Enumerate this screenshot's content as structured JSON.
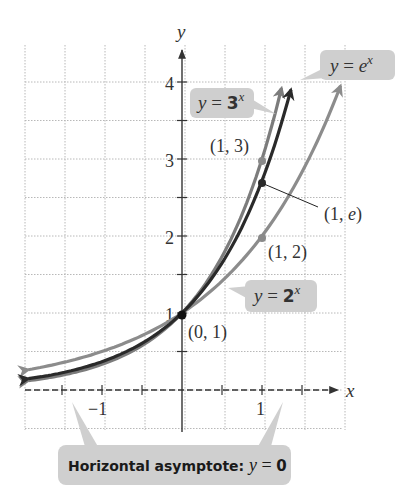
{
  "chart_data": {
    "type": "line",
    "title": "",
    "xlabel": "x",
    "ylabel": "y",
    "xlim": [
      -2,
      2
    ],
    "ylim": [
      -1,
      4.5
    ],
    "grid": true,
    "x_ticks": [
      {
        "value": -1,
        "label": "−1"
      },
      {
        "value": 1,
        "label": "1"
      }
    ],
    "y_ticks": [
      {
        "value": 1,
        "label": "1"
      },
      {
        "value": 2,
        "label": "2"
      },
      {
        "value": 3,
        "label": "3"
      },
      {
        "value": 4,
        "label": "4"
      }
    ],
    "series": [
      {
        "name": "y = 2^x",
        "label_base": "y = ",
        "label_num": "2",
        "label_exp": "x",
        "base": 2,
        "color": "#8a8a8a"
      },
      {
        "name": "y = e^x",
        "label_base": "y = e",
        "label_num": "",
        "label_exp": "x",
        "base": 2.718281828,
        "color": "#2b2b2b"
      },
      {
        "name": "y = 3^x",
        "label_base": "y = ",
        "label_num": "3",
        "label_exp": "x",
        "base": 3,
        "color": "#7a7a7a"
      }
    ],
    "points": [
      {
        "x": 0,
        "y": 1,
        "label": "(0, 1)"
      },
      {
        "x": 1,
        "y": 3,
        "label": "(1, 3)"
      },
      {
        "x": 1,
        "y": 2.718,
        "label": "(1, e)"
      },
      {
        "x": 1,
        "y": 2,
        "label": "(1, 2)"
      }
    ],
    "annotations": [
      {
        "text_prefix": "Horizontal asymptote: ",
        "text_var": "y",
        "text_suffix": " = 0"
      }
    ]
  },
  "labels": {
    "x_axis": "x",
    "y_axis": "y",
    "tick_x_neg1": "−1",
    "tick_x_1": "1",
    "tick_y_1": "1",
    "tick_y_2": "2",
    "tick_y_3": "3",
    "tick_y_4": "4",
    "pt_01": "(0, 1)",
    "pt_13": "(1, 3)",
    "pt_1e": "(1, e)",
    "pt_12": "(1, 2)",
    "callout_ex_y": "y = e",
    "callout_ex_exp": "x",
    "callout_3x_y": "y = ",
    "callout_3x_num": "3",
    "callout_3x_exp": "x",
    "callout_2x_y": "y = ",
    "callout_2x_num": "2",
    "callout_2x_exp": "x",
    "asym_prefix": "Horizontal asymptote: ",
    "asym_var": "y",
    "asym_eq": " = ",
    "asym_zero": "0"
  },
  "colors": {
    "grid": "#b8b8b8",
    "axis": "#333333",
    "callout_bg": "#cfcfcf",
    "curve_2x": "#8c8c8c",
    "curve_ex": "#2a2a2a",
    "curve_3x": "#7c7c7c"
  }
}
